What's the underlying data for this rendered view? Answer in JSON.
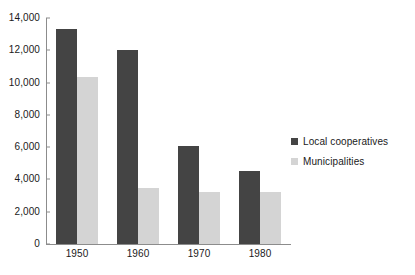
{
  "chart_data": {
    "type": "bar",
    "title": "",
    "subtitle": "",
    "xlabel": "",
    "ylabel": "",
    "categories": [
      "1950",
      "1960",
      "1970",
      "1980"
    ],
    "series": [
      {
        "name": "Local cooperatives",
        "color": "#444444",
        "values": [
          13300,
          12000,
          6100,
          4500
        ]
      },
      {
        "name": "Municipalities",
        "color": "#d4d4d4",
        "values": [
          10350,
          3480,
          3200,
          3200
        ]
      }
    ],
    "ylim": [
      0,
      14000
    ],
    "ytick_step": 2000,
    "ytick_labels": [
      "0",
      "2,000",
      "4,000",
      "6,000",
      "8,000",
      "10,000",
      "12,000",
      "14,000"
    ],
    "ytick_values": [
      0,
      2000,
      4000,
      6000,
      8000,
      10000,
      12000,
      14000
    ],
    "grid": false,
    "legend_position": "right",
    "axis_color": "#8c8c8c",
    "background": "#ffffff"
  }
}
